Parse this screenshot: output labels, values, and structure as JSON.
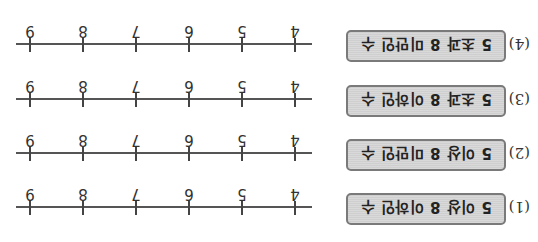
{
  "problems": [
    {
      "number": "(1)",
      "condition": "5 이상 8 이하인 수"
    },
    {
      "number": "(2)",
      "condition": "5 이상 8 미만인 수"
    },
    {
      "number": "(3)",
      "condition": "5 초과 8 이하인 수"
    },
    {
      "number": "(4)",
      "condition": "5 초과 8 미만인 수"
    }
  ],
  "number_line": {
    "ticks": [
      "4",
      "5",
      "6",
      "7",
      "8",
      "9"
    ]
  },
  "orientation": "rotated-180"
}
